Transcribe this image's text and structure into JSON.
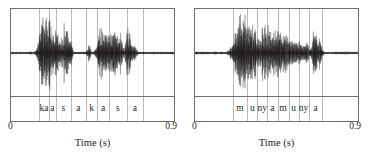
{
  "figure": {
    "type": "waveform-segmentation",
    "panel_count": 2,
    "colors": {
      "frame": "#6e6e6e",
      "gridline": "#b9b9b9",
      "waveform": "#231f20",
      "background": "#ffffff",
      "text": "#231f20"
    }
  },
  "panels": [
    {
      "id": "panel-left",
      "axis": {
        "label": "Time (s)",
        "min_label": "0",
        "max_label": "0.9",
        "min": 0,
        "max": 0.9
      },
      "utterance": "ka sa ka sa",
      "segments": [
        {
          "label": "ka",
          "start": 0.155,
          "end": 0.205
        },
        {
          "label": "a",
          "start": 0.205,
          "end": 0.245
        },
        {
          "label": "s",
          "start": 0.245,
          "end": 0.325
        },
        {
          "label": "a",
          "start": 0.325,
          "end": 0.41
        },
        {
          "label": "k",
          "start": 0.41,
          "end": 0.47
        },
        {
          "label": "a",
          "start": 0.47,
          "end": 0.535
        },
        {
          "label": "s",
          "start": 0.535,
          "end": 0.63
        },
        {
          "label": "a",
          "start": 0.63,
          "end": 0.72
        }
      ],
      "chart_data": {
        "type": "line",
        "title": "",
        "xlabel": "Time (s)",
        "ylabel": "",
        "xlim": [
          0,
          0.9
        ],
        "ylim": [
          -1,
          1
        ],
        "grid": true,
        "series_name": "amplitude",
        "bursts": [
          {
            "center": 0.175,
            "width": 0.022,
            "amp": 0.92
          },
          {
            "center": 0.205,
            "width": 0.012,
            "amp": 0.55
          },
          {
            "center": 0.228,
            "width": 0.03,
            "amp": 0.62
          },
          {
            "center": 0.262,
            "width": 0.012,
            "amp": 0.3
          },
          {
            "center": 0.3,
            "width": 0.02,
            "amp": 0.78
          },
          {
            "center": 0.33,
            "width": 0.01,
            "amp": 0.28
          },
          {
            "center": 0.43,
            "width": 0.008,
            "amp": 0.24
          },
          {
            "center": 0.492,
            "width": 0.018,
            "amp": 0.62
          },
          {
            "center": 0.52,
            "width": 0.014,
            "amp": 0.35
          },
          {
            "center": 0.56,
            "width": 0.032,
            "amp": 0.6
          },
          {
            "center": 0.6,
            "width": 0.016,
            "amp": 0.4
          },
          {
            "center": 0.648,
            "width": 0.016,
            "amp": 0.58
          },
          {
            "center": 0.68,
            "width": 0.012,
            "amp": 0.22
          }
        ],
        "noise_floor": 0.035
      }
    },
    {
      "id": "panel-right",
      "axis": {
        "label": "Time (s)",
        "min_label": "0",
        "max_label": "0.9",
        "min": 0,
        "max": 0.9
      },
      "utterance": "mu nya mu nya",
      "segments": [
        {
          "label": "m",
          "start": 0.205,
          "end": 0.285
        },
        {
          "label": "u",
          "start": 0.285,
          "end": 0.34
        },
        {
          "label": "ny",
          "start": 0.34,
          "end": 0.395
        },
        {
          "label": "a",
          "start": 0.395,
          "end": 0.45
        },
        {
          "label": "m",
          "start": 0.45,
          "end": 0.51
        },
        {
          "label": "u",
          "start": 0.51,
          "end": 0.565
        },
        {
          "label": "ny",
          "start": 0.565,
          "end": 0.62
        },
        {
          "label": "a",
          "start": 0.62,
          "end": 0.695
        }
      ],
      "chart_data": {
        "type": "line",
        "title": "",
        "xlabel": "Time (s)",
        "ylabel": "",
        "xlim": [
          0,
          0.9
        ],
        "ylim": [
          -1,
          1
        ],
        "grid": true,
        "series_name": "amplitude",
        "bursts": [
          {
            "center": 0.235,
            "width": 0.03,
            "amp": 0.6
          },
          {
            "center": 0.268,
            "width": 0.022,
            "amp": 0.9
          },
          {
            "center": 0.3,
            "width": 0.028,
            "amp": 0.66
          },
          {
            "center": 0.33,
            "width": 0.016,
            "amp": 0.4
          },
          {
            "center": 0.378,
            "width": 0.028,
            "amp": 0.62
          },
          {
            "center": 0.412,
            "width": 0.02,
            "amp": 0.45
          },
          {
            "center": 0.45,
            "width": 0.026,
            "amp": 0.48
          },
          {
            "center": 0.492,
            "width": 0.026,
            "amp": 0.4
          },
          {
            "center": 0.535,
            "width": 0.026,
            "amp": 0.34
          },
          {
            "center": 0.578,
            "width": 0.022,
            "amp": 0.28
          },
          {
            "center": 0.618,
            "width": 0.014,
            "amp": 0.24
          },
          {
            "center": 0.66,
            "width": 0.014,
            "amp": 0.72
          },
          {
            "center": 0.69,
            "width": 0.012,
            "amp": 0.3
          }
        ],
        "noise_floor": 0.035
      }
    }
  ]
}
